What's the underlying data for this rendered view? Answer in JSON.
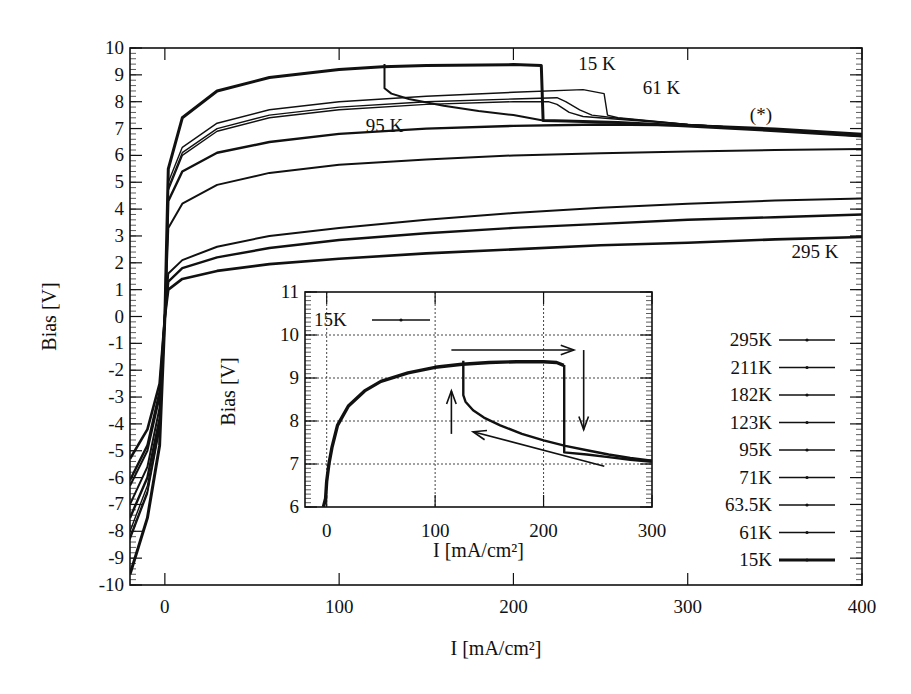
{
  "chart_data": [
    {
      "id": "main",
      "type": "line",
      "title": "",
      "xlabel": "I [mA/cm²]",
      "ylabel": "Bias [V]",
      "xlim": [
        -20,
        400
      ],
      "ylim": [
        -10,
        10
      ],
      "xticks": [
        0,
        100,
        200,
        300,
        400
      ],
      "yticks": [
        -10,
        -9,
        -8,
        -7,
        -6,
        -5,
        -4,
        -3,
        -2,
        -1,
        0,
        1,
        2,
        3,
        4,
        5,
        6,
        7,
        8,
        9,
        10
      ],
      "grid": false,
      "legend_position": "lower right",
      "legend": [
        "295K",
        "211K",
        "182K",
        "123K",
        "95K",
        "71K",
        "63.5K",
        "61K",
        "15K"
      ],
      "annotations": [
        {
          "text": "15 K",
          "x": 248,
          "y": 9.4
        },
        {
          "text": "61 K",
          "x": 285,
          "y": 8.5
        },
        {
          "text": "95 K",
          "x": 126,
          "y": 7.1
        },
        {
          "text": "(*)",
          "x": 342,
          "y": 7.5
        },
        {
          "text": "295 K",
          "x": 373,
          "y": 2.4
        }
      ],
      "series": [
        {
          "name": "295K",
          "width": 2.6,
          "x": [
            -20,
            -10,
            -3,
            0,
            2,
            10,
            30,
            60,
            100,
            150,
            200,
            250,
            300,
            350,
            400
          ],
          "y": [
            -5.3,
            -4.2,
            -2.5,
            0,
            1.0,
            1.4,
            1.7,
            1.95,
            2.15,
            2.35,
            2.5,
            2.65,
            2.75,
            2.87,
            2.96
          ]
        },
        {
          "name": "211K",
          "width": 2.4,
          "x": [
            -20,
            -10,
            -3,
            0,
            2,
            10,
            30,
            60,
            100,
            150,
            200,
            250,
            300,
            350,
            400
          ],
          "y": [
            -6.1,
            -4.8,
            -2.8,
            0,
            1.3,
            1.8,
            2.2,
            2.55,
            2.85,
            3.1,
            3.3,
            3.45,
            3.6,
            3.7,
            3.8
          ]
        },
        {
          "name": "182K",
          "width": 2.0,
          "x": [
            -20,
            -10,
            -3,
            0,
            2,
            10,
            30,
            60,
            100,
            150,
            200,
            250,
            300,
            350,
            400
          ],
          "y": [
            -6.3,
            -5.0,
            -3.0,
            0,
            1.6,
            2.1,
            2.6,
            3.0,
            3.3,
            3.6,
            3.85,
            4.05,
            4.2,
            4.32,
            4.4
          ]
        },
        {
          "name": "123K",
          "width": 2.0,
          "x": [
            -20,
            -10,
            -3,
            0,
            2,
            10,
            30,
            60,
            100,
            150,
            200,
            250,
            300,
            350,
            400
          ],
          "y": [
            -7.0,
            -5.6,
            -3.4,
            0,
            3.3,
            4.2,
            4.9,
            5.35,
            5.65,
            5.85,
            6.0,
            6.08,
            6.15,
            6.2,
            6.24
          ]
        },
        {
          "name": "95K",
          "width": 2.4,
          "x": [
            -20,
            -10,
            -3,
            0,
            2,
            10,
            30,
            60,
            100,
            150,
            200,
            250,
            300,
            350,
            400
          ],
          "y": [
            -7.5,
            -6.0,
            -3.8,
            0,
            4.3,
            5.4,
            6.1,
            6.5,
            6.8,
            7.0,
            7.1,
            7.15,
            7.12,
            7.0,
            6.8
          ]
        },
        {
          "name": "71K",
          "width": 1.4,
          "x": [
            -20,
            -10,
            -3,
            0,
            2,
            10,
            30,
            60,
            100,
            150,
            200,
            220,
            225,
            232,
            240,
            260,
            300,
            350,
            400
          ],
          "y": [
            -8.0,
            -6.3,
            -4.0,
            0,
            4.7,
            6.0,
            6.9,
            7.4,
            7.7,
            7.9,
            8.0,
            8.0,
            7.9,
            7.6,
            7.45,
            7.35,
            7.15,
            6.95,
            6.75
          ]
        },
        {
          "name": "63.5K",
          "width": 1.4,
          "x": [
            -20,
            -10,
            -3,
            0,
            2,
            10,
            30,
            60,
            100,
            150,
            200,
            225,
            230,
            238,
            245,
            260,
            300,
            350,
            400
          ],
          "y": [
            -8.2,
            -6.5,
            -4.1,
            0,
            4.8,
            6.1,
            7.0,
            7.5,
            7.8,
            8.0,
            8.1,
            8.15,
            8.0,
            7.7,
            7.5,
            7.38,
            7.15,
            6.95,
            6.72
          ]
        },
        {
          "name": "61K",
          "width": 1.4,
          "x": [
            -20,
            -10,
            -3,
            0,
            2,
            10,
            30,
            60,
            100,
            150,
            200,
            240,
            252,
            254,
            260,
            300,
            350,
            400
          ],
          "y": [
            -8.3,
            -6.6,
            -4.2,
            0,
            5.0,
            6.3,
            7.2,
            7.7,
            8.0,
            8.2,
            8.35,
            8.45,
            8.3,
            7.5,
            7.4,
            7.15,
            6.95,
            6.7
          ]
        },
        {
          "name": "15K",
          "width": 3.0,
          "x": [
            -20,
            -10,
            -3,
            0,
            2,
            10,
            30,
            60,
            100,
            125,
            150,
            200,
            216,
            217,
            230,
            260,
            300,
            350,
            400
          ],
          "y": [
            -9.6,
            -7.5,
            -4.8,
            0,
            5.5,
            7.4,
            8.4,
            8.9,
            9.2,
            9.3,
            9.35,
            9.38,
            9.35,
            7.3,
            7.28,
            7.22,
            7.1,
            6.92,
            6.72
          ]
        },
        {
          "name": "15K-return",
          "width": 2.0,
          "x": [
            217,
            200,
            180,
            160,
            140,
            130,
            126,
            126
          ],
          "y": [
            7.3,
            7.5,
            7.65,
            7.85,
            8.1,
            8.3,
            8.5,
            9.4
          ]
        }
      ]
    },
    {
      "id": "inset",
      "type": "line",
      "title": "",
      "xlabel": "I [mA/cm²]",
      "ylabel": "Bias [V]",
      "xlim": [
        -20,
        300
      ],
      "ylim": [
        6,
        11
      ],
      "xticks": [
        0,
        100,
        200,
        300
      ],
      "yticks": [
        6,
        7,
        8,
        9,
        10,
        11
      ],
      "grid": true,
      "legend_position": "upper left",
      "legend": [
        "15K"
      ],
      "annotations": [
        {
          "type": "arrow",
          "direction": "right",
          "from": [
            115,
            9.65
          ],
          "to": [
            228,
            9.65
          ]
        },
        {
          "type": "arrow",
          "direction": "down",
          "from": [
            237,
            9.65
          ],
          "to": [
            237,
            7.8
          ]
        },
        {
          "type": "arrow",
          "direction": "left",
          "from": [
            256,
            6.95
          ],
          "to": [
            135,
            7.75
          ]
        },
        {
          "type": "arrow",
          "direction": "up",
          "from": [
            115,
            7.7
          ],
          "to": [
            115,
            8.7
          ]
        }
      ],
      "series": [
        {
          "name": "15K-up",
          "x": [
            -3,
            -1,
            0,
            2,
            5,
            10,
            20,
            35,
            50,
            75,
            100,
            125,
            150,
            175,
            200,
            212,
            218,
            219
          ],
          "y": [
            6.0,
            6.2,
            6.6,
            7.0,
            7.4,
            7.9,
            8.35,
            8.7,
            8.92,
            9.12,
            9.25,
            9.32,
            9.36,
            9.38,
            9.38,
            9.36,
            9.3,
            9.3
          ]
        },
        {
          "name": "15K-drop",
          "x": [
            219,
            219,
            240,
            260,
            280,
            300
          ],
          "y": [
            9.3,
            7.27,
            7.22,
            7.16,
            7.1,
            7.05
          ]
        },
        {
          "name": "15K-down",
          "x": [
            300,
            280,
            260,
            240,
            220,
            200,
            180,
            160,
            145,
            135,
            128,
            126,
            126
          ],
          "y": [
            7.08,
            7.14,
            7.22,
            7.32,
            7.42,
            7.55,
            7.7,
            7.9,
            8.08,
            8.25,
            8.45,
            8.6,
            9.4
          ]
        }
      ]
    }
  ],
  "inset_legend_label": "15K"
}
